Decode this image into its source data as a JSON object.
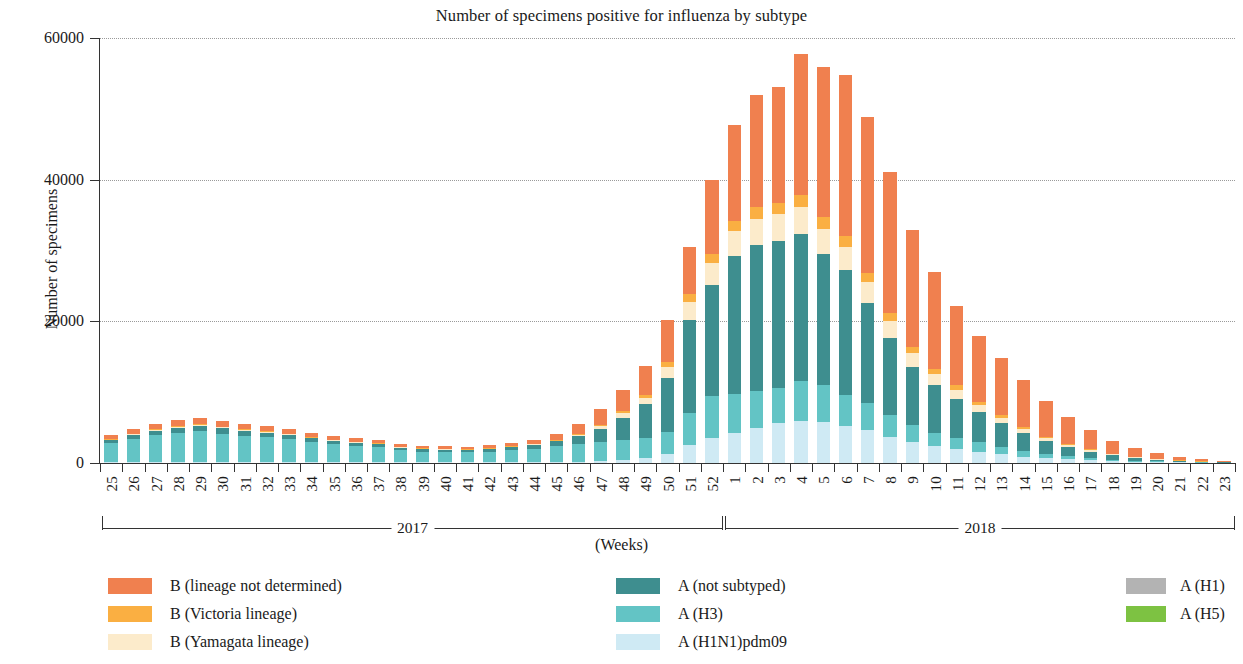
{
  "chart_data": {
    "type": "bar",
    "title": "Number of specimens positive for influenza by subtype",
    "xlabel": "(Weeks)",
    "ylabel": "Number of specimens",
    "ylim": [
      0,
      60000
    ],
    "yticks": [
      0,
      20000,
      40000,
      60000
    ],
    "ytick_labels": [
      "0",
      "20000",
      "40000",
      "60000"
    ],
    "grid": true,
    "stacked": true,
    "legend_position": "bottom",
    "categories": [
      "25",
      "26",
      "27",
      "28",
      "29",
      "30",
      "31",
      "32",
      "33",
      "34",
      "35",
      "36",
      "37",
      "38",
      "39",
      "40",
      "41",
      "42",
      "43",
      "44",
      "45",
      "46",
      "47",
      "48",
      "49",
      "50",
      "51",
      "52",
      "1",
      "2",
      "3",
      "4",
      "5",
      "6",
      "7",
      "8",
      "9",
      "10",
      "11",
      "12",
      "13",
      "14",
      "15",
      "16",
      "17",
      "18",
      "19",
      "20",
      "21",
      "22",
      "23"
    ],
    "group_labels": [
      "2017",
      "2018"
    ],
    "groups": [
      {
        "label": "2017",
        "start_index": 0,
        "end_index": 27
      },
      {
        "label": "2018",
        "start_index": 28,
        "end_index": 50
      }
    ],
    "series": [
      {
        "name": "A (H1N1)pdm09",
        "color": "#CFEAF4",
        "values": [
          120,
          140,
          150,
          160,
          170,
          160,
          150,
          140,
          130,
          120,
          120,
          110,
          110,
          100,
          100,
          100,
          100,
          100,
          110,
          120,
          140,
          180,
          260,
          420,
          700,
          1300,
          2600,
          3500,
          4300,
          5000,
          5600,
          5900,
          5800,
          5200,
          4600,
          3700,
          2900,
          2400,
          2000,
          1600,
          1250,
          900,
          700,
          520,
          380,
          260,
          180,
          120,
          80,
          50,
          30
        ]
      },
      {
        "name": "A (H3)",
        "color": "#63C4C5",
        "values": [
          2700,
          3300,
          3800,
          4100,
          4300,
          4000,
          3700,
          3500,
          3200,
          2800,
          2500,
          2300,
          2100,
          1700,
          1500,
          1450,
          1400,
          1500,
          1700,
          1900,
          2200,
          2500,
          2700,
          2800,
          2900,
          3100,
          4500,
          5900,
          5500,
          5200,
          5000,
          5700,
          5200,
          4400,
          3900,
          3100,
          2400,
          1900,
          1600,
          1300,
          1000,
          750,
          560,
          420,
          300,
          210,
          140,
          95,
          60,
          40,
          25
        ]
      },
      {
        "name": "A (not subtyped)",
        "color": "#3E8E8F",
        "values": [
          400,
          500,
          600,
          700,
          800,
          750,
          700,
          650,
          600,
          550,
          500,
          450,
          420,
          380,
          350,
          330,
          320,
          350,
          420,
          500,
          700,
          1100,
          1900,
          3200,
          4700,
          7600,
          13100,
          15700,
          19400,
          20600,
          20700,
          20800,
          18500,
          17600,
          14100,
          10800,
          8300,
          6700,
          5500,
          4300,
          3400,
          2600,
          1800,
          1300,
          900,
          600,
          400,
          260,
          170,
          100,
          60
        ]
      },
      {
        "name": "B (Yamagata lineage)",
        "color": "#FCEBCB",
        "values": [
          100,
          120,
          140,
          150,
          160,
          150,
          140,
          130,
          120,
          110,
          100,
          95,
          90,
          85,
          80,
          80,
          80,
          85,
          95,
          110,
          140,
          200,
          350,
          600,
          950,
          1600,
          2600,
          3100,
          3500,
          3700,
          3800,
          3800,
          3600,
          3300,
          2900,
          2400,
          1900,
          1500,
          1200,
          950,
          750,
          560,
          420,
          300,
          210,
          150,
          100,
          65,
          40,
          25,
          15
        ]
      },
      {
        "name": "B (Victoria lineage)",
        "color": "#FAAF42",
        "values": [
          60,
          70,
          80,
          90,
          95,
          90,
          85,
          80,
          75,
          70,
          65,
          60,
          58,
          55,
          52,
          50,
          50,
          55,
          60,
          70,
          85,
          120,
          180,
          280,
          420,
          700,
          1100,
          1300,
          1500,
          1600,
          1650,
          1700,
          1600,
          1500,
          1350,
          1150,
          950,
          800,
          650,
          520,
          420,
          320,
          240,
          180,
          130,
          90,
          60,
          40,
          25,
          15,
          10
        ]
      },
      {
        "name": "B (lineage not determined)",
        "color": "#F0804F",
        "values": [
          550,
          700,
          800,
          850,
          900,
          800,
          750,
          700,
          650,
          600,
          550,
          500,
          470,
          420,
          380,
          360,
          350,
          400,
          480,
          600,
          800,
          1400,
          2200,
          3000,
          4000,
          5900,
          6600,
          10400,
          13500,
          15800,
          16400,
          19900,
          21200,
          22800,
          22000,
          19900,
          16400,
          13600,
          11200,
          9300,
          8000,
          6600,
          5000,
          3800,
          2700,
          1800,
          1200,
          780,
          500,
          320,
          190
        ]
      },
      {
        "name": "A (H1)",
        "color": "#B3B3B3",
        "values": [
          0,
          0,
          0,
          0,
          0,
          0,
          0,
          0,
          0,
          0,
          0,
          0,
          0,
          0,
          0,
          0,
          0,
          0,
          0,
          0,
          0,
          0,
          0,
          0,
          0,
          0,
          0,
          0,
          0,
          0,
          0,
          0,
          0,
          0,
          0,
          0,
          0,
          0,
          0,
          0,
          0,
          0,
          0,
          0,
          0,
          0,
          0,
          0,
          0,
          0,
          0
        ]
      },
      {
        "name": "A (H5)",
        "color": "#7DC242",
        "values": [
          0,
          0,
          0,
          0,
          0,
          0,
          0,
          0,
          0,
          0,
          0,
          0,
          0,
          0,
          0,
          0,
          0,
          0,
          0,
          0,
          0,
          0,
          0,
          0,
          0,
          0,
          0,
          0,
          0,
          0,
          0,
          0,
          0,
          0,
          0,
          0,
          0,
          0,
          0,
          0,
          0,
          0,
          0,
          0,
          0,
          0,
          0,
          0,
          0,
          0,
          0
        ]
      }
    ]
  },
  "legend": {
    "columns": [
      {
        "items": [
          {
            "label": "B (lineage not determined)",
            "color": "#F0804F"
          },
          {
            "label": "B (Victoria lineage)",
            "color": "#FAAF42"
          },
          {
            "label": "B (Yamagata lineage)",
            "color": "#FCEBCB"
          }
        ]
      },
      {
        "items": [
          {
            "label": "A (not subtyped)",
            "color": "#3E8E8F"
          },
          {
            "label": "A (H3)",
            "color": "#63C4C5"
          },
          {
            "label": "A (H1N1)pdm09",
            "color": "#CFEAF4"
          }
        ]
      },
      {
        "items": [
          {
            "label": "A (H1)",
            "color": "#B3B3B3"
          },
          {
            "label": "A (H5)",
            "color": "#7DC242"
          }
        ]
      }
    ]
  }
}
